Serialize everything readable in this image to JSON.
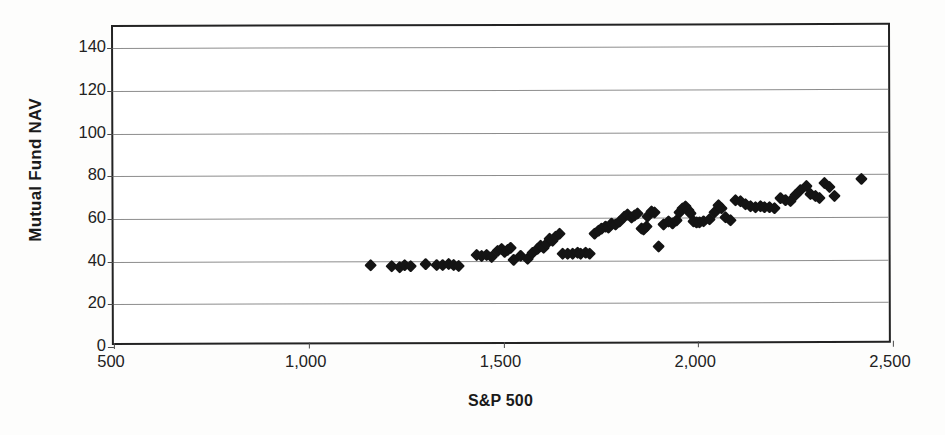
{
  "chart_data": {
    "type": "scatter",
    "title": "",
    "xlabel": "S&P 500",
    "ylabel": "Mutual Fund NAV",
    "xlim": [
      500,
      2500
    ],
    "ylim": [
      0,
      150
    ],
    "grid": true,
    "legend": null,
    "marker": "diamond",
    "marker_color": "#141414",
    "x_ticks": [
      500,
      1000,
      1500,
      2000,
      2500
    ],
    "x_tick_labels": [
      "500",
      "1,000",
      "1,500",
      "2,000",
      "2,500"
    ],
    "y_ticks": [
      0,
      20,
      40,
      60,
      80,
      100,
      120,
      140
    ],
    "y_tick_labels": [
      "0",
      "20",
      "40",
      "60",
      "80",
      "100",
      "120",
      "140"
    ],
    "points": [
      [
        1160,
        38.0
      ],
      [
        1215,
        37.5
      ],
      [
        1235,
        37.0
      ],
      [
        1248,
        38.0
      ],
      [
        1262,
        37.5
      ],
      [
        1300,
        38.5
      ],
      [
        1330,
        38.0
      ],
      [
        1345,
        38.0
      ],
      [
        1360,
        38.5
      ],
      [
        1372,
        38.0
      ],
      [
        1385,
        37.5
      ],
      [
        1432,
        42.5
      ],
      [
        1445,
        42.0
      ],
      [
        1458,
        42.5
      ],
      [
        1470,
        41.5
      ],
      [
        1485,
        44.5
      ],
      [
        1496,
        45.5
      ],
      [
        1505,
        44.0
      ],
      [
        1512,
        45.0
      ],
      [
        1520,
        46.0
      ],
      [
        1528,
        40.5
      ],
      [
        1545,
        42.0
      ],
      [
        1562,
        41.0
      ],
      [
        1575,
        43.5
      ],
      [
        1588,
        45.5
      ],
      [
        1596,
        47.0
      ],
      [
        1604,
        46.0
      ],
      [
        1612,
        48.0
      ],
      [
        1620,
        50.0
      ],
      [
        1628,
        49.0
      ],
      [
        1636,
        51.0
      ],
      [
        1645,
        52.5
      ],
      [
        1652,
        43.0
      ],
      [
        1665,
        43.0
      ],
      [
        1678,
        43.0
      ],
      [
        1690,
        43.5
      ],
      [
        1700,
        43.0
      ],
      [
        1712,
        43.5
      ],
      [
        1722,
        43.0
      ],
      [
        1735,
        52.5
      ],
      [
        1745,
        54.0
      ],
      [
        1752,
        55.0
      ],
      [
        1762,
        56.0
      ],
      [
        1770,
        55.5
      ],
      [
        1778,
        57.0
      ],
      [
        1790,
        56.5
      ],
      [
        1800,
        58.0
      ],
      [
        1812,
        60.5
      ],
      [
        1820,
        61.5
      ],
      [
        1830,
        60.0
      ],
      [
        1838,
        61.0
      ],
      [
        1846,
        62.0
      ],
      [
        1855,
        55.0
      ],
      [
        1862,
        54.5
      ],
      [
        1868,
        56.0
      ],
      [
        1872,
        60.5
      ],
      [
        1880,
        63.0
      ],
      [
        1888,
        62.5
      ],
      [
        1900,
        46.5
      ],
      [
        1912,
        56.5
      ],
      [
        1925,
        58.0
      ],
      [
        1935,
        57.0
      ],
      [
        1945,
        58.5
      ],
      [
        1952,
        62.5
      ],
      [
        1960,
        64.0
      ],
      [
        1968,
        65.0
      ],
      [
        1975,
        63.5
      ],
      [
        1982,
        62.0
      ],
      [
        1990,
        58.0
      ],
      [
        1998,
        57.5
      ],
      [
        2005,
        57.5
      ],
      [
        2015,
        58.0
      ],
      [
        2030,
        59.0
      ],
      [
        2042,
        62.5
      ],
      [
        2052,
        65.5
      ],
      [
        2062,
        64.0
      ],
      [
        2072,
        60.0
      ],
      [
        2085,
        58.5
      ],
      [
        2098,
        68.0
      ],
      [
        2110,
        67.5
      ],
      [
        2122,
        66.0
      ],
      [
        2135,
        65.0
      ],
      [
        2148,
        64.5
      ],
      [
        2160,
        65.0
      ],
      [
        2172,
        64.5
      ],
      [
        2185,
        64.5
      ],
      [
        2198,
        64.0
      ],
      [
        2212,
        69.0
      ],
      [
        2225,
        68.0
      ],
      [
        2238,
        67.5
      ],
      [
        2252,
        70.5
      ],
      [
        2265,
        72.5
      ],
      [
        2278,
        74.5
      ],
      [
        2290,
        71.0
      ],
      [
        2302,
        70.0
      ],
      [
        2312,
        69.0
      ],
      [
        2325,
        76.0
      ],
      [
        2338,
        74.0
      ],
      [
        2350,
        70.0
      ],
      [
        2420,
        78.0
      ]
    ]
  }
}
